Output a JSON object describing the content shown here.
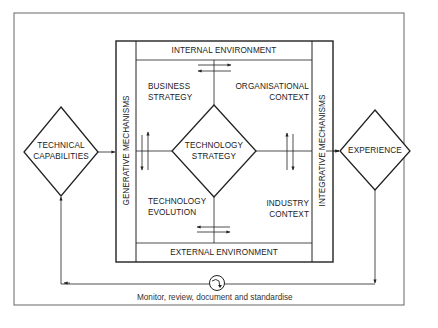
{
  "diagram": {
    "type": "flow-framework",
    "center_node": {
      "label_line1": "TECHNOLOGY",
      "label_line2": "STRATEGY",
      "shape": "diamond"
    },
    "left_node": {
      "label_line1": "TECHNICAL",
      "label_line2": "CAPABILITIES",
      "shape": "diamond"
    },
    "right_node": {
      "label": "EXPERIENCE",
      "shape": "diamond"
    },
    "bands": {
      "top": "INTERNAL ENVIRONMENT",
      "bottom": "EXTERNAL ENVIRONMENT",
      "left": "GENERATIVE MECHANISMS",
      "right": "INTEGRATIVE MECHANISMS"
    },
    "quadrants": {
      "top_left": {
        "line1": "BUSINESS",
        "line2": "STRATEGY"
      },
      "top_right": {
        "line1": "ORGANISATIONAL",
        "line2": "CONTEXT"
      },
      "bottom_left": {
        "line1": "TECHNOLOGY",
        "line2": "EVOLUTION"
      },
      "bottom_right": {
        "line1": "INDUSTRY",
        "line2": "CONTEXT"
      }
    },
    "feedback_loop": {
      "label": "Monitor, review, document and standardise",
      "icon": "cycle-arrow-icon"
    },
    "colors": {
      "line": "#222222",
      "frame": "#555555",
      "background": "#ffffff"
    }
  }
}
